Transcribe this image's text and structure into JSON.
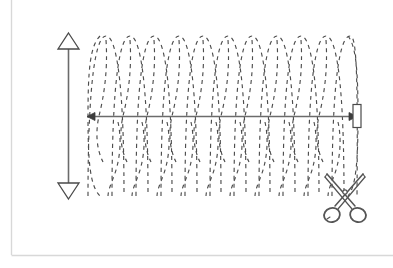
{
  "document": {
    "title": "Dashed Coil Cut Diagram",
    "background_color": "#ffffff"
  },
  "frame": {
    "name": "page-frame",
    "border_color": "#d6d6d6",
    "left": 11,
    "top": 0,
    "right": 392,
    "bottom": 255
  },
  "figure": {
    "stroke_color": "#5a5a5a",
    "dash_color": "#4d4d4d",
    "fill_color": "#ffffff",
    "elements": [
      "vertical-dimension-arrow",
      "horizontal-dimension-arrow",
      "dashed-coil",
      "end-cap-rectangle",
      "scissors-icon"
    ]
  },
  "vertical_arrow": {
    "name": "vertical-dimension-arrow",
    "x": 68,
    "top_y": 36,
    "bottom_y": 196,
    "head_style": "hollow-triangle",
    "head_width": 20,
    "head_height": 14,
    "double_headed": true,
    "color": "#5a5a5a"
  },
  "horizontal_arrow": {
    "name": "horizontal-dimension-arrow",
    "y": 116,
    "left_x": 88,
    "right_x": 355,
    "head_style": "solid-triangle",
    "head_width": 7,
    "head_height": 6,
    "double_headed": true,
    "color": "#5a5a5a"
  },
  "end_cap": {
    "name": "end-cap-rectangle",
    "x": 353,
    "y": 104,
    "width": 8,
    "height": 23,
    "fill": "#ffffff",
    "stroke": "#5a5a5a"
  },
  "coil": {
    "name": "dashed-coil",
    "start_x": 88,
    "end_x": 357,
    "center_y": 116,
    "top_y": 36,
    "bottom_y": 196,
    "amplitude": 80,
    "turns": 11,
    "period": 24.5,
    "dash_pattern": "4 4",
    "stroke_width": 1.1,
    "color": "#4d4d4d",
    "style": "helix"
  },
  "scissors": {
    "name": "scissors-icon",
    "x": 318,
    "y": 172,
    "width": 56,
    "height": 56,
    "color": "#555555",
    "blade_count": 2,
    "handle_count": 2,
    "rotation_deg": 0,
    "semantic": "cut-here"
  },
  "labels": {
    "vertical_arrow_label": "",
    "horizontal_arrow_label": "",
    "scissors_label": ""
  }
}
